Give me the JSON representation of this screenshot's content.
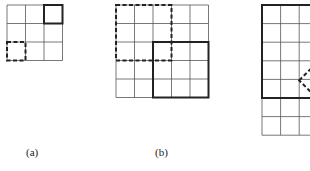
{
  "figure": {
    "panels": [
      {
        "id": "a",
        "label": "(a)",
        "grid": {
          "rows": 3,
          "cols": 3,
          "x": 7,
          "y": 5,
          "cell": 18.5
        },
        "solid_window": {
          "row": 0,
          "col": 2,
          "size": 1
        },
        "dashed_window": {
          "row": 2,
          "col": 0,
          "size": 1
        }
      },
      {
        "id": "b",
        "label": "(b)",
        "grid": {
          "rows": 5,
          "cols": 5,
          "x": 116,
          "y": 5,
          "cell": 18.5
        },
        "solid_window": {
          "row": 2,
          "col": 2,
          "size": 3
        },
        "dashed_window": {
          "row": 0,
          "col": 0,
          "size": 3
        }
      },
      {
        "id": "c",
        "label": "",
        "grid": {
          "rows": 7,
          "cols": 3,
          "x": 262,
          "y": 5,
          "cell": 18.6
        },
        "solid_window": {
          "row": 0,
          "col": 0,
          "size": 5
        },
        "dashed_shape": "diamond"
      }
    ],
    "colors": {
      "line": "#555555",
      "bold": "#222222"
    }
  }
}
